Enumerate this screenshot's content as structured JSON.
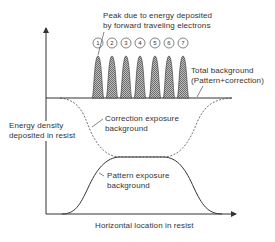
{
  "diagram": {
    "annotations": {
      "peak_label": [
        "Peak due to energy deposited",
        "by forward traveling electrons"
      ],
      "total_background": [
        "Total background",
        "(Pattern+correction)"
      ],
      "correction_background": [
        "Correction exposure",
        "background"
      ],
      "pattern_background": [
        "Pattern exposure",
        "background"
      ]
    },
    "axes": {
      "y_label": [
        "Energy density",
        "deposited in resist"
      ],
      "x_label": "Horizontal location in resist"
    },
    "peak_numbers": [
      "1",
      "2",
      "3",
      "4",
      "5",
      "6",
      "7"
    ],
    "colors": {
      "line": "#333333",
      "peak_fill": "#8a8a8a",
      "background": "#ffffff"
    }
  }
}
